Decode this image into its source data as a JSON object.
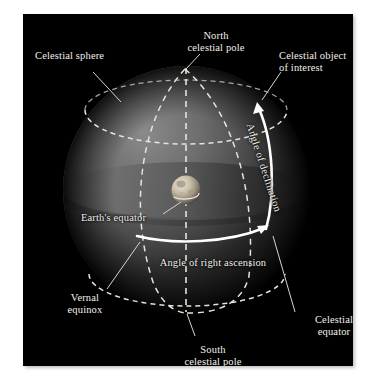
{
  "figure": {
    "background_color": "#ffffff",
    "panel_color": "#000000",
    "label_color": "#f2f0ea",
    "sphere_light_color": "#6a6a6a",
    "sphere_dark_color": "#0b0b0b",
    "equator_plane_color": "#5e5e5e",
    "earth_color": "#cfc6b4",
    "arrow_color": "#ffffff",
    "dashed_line_color": "#e8e4da"
  },
  "labels": {
    "celestial_sphere": "Celestial sphere",
    "north_celestial_pole": "North\ncelestial pole",
    "celestial_object": "Celestial object\nof interest",
    "angle_of_declination": "Angle of declination",
    "earths_equator": "Earth's equator",
    "angle_of_right_ascension": "Angle of right ascension",
    "vernal_equinox": "Vernal\nequinox",
    "south_celestial_pole": "South\ncelestial pole",
    "celestial_equator": "Celestial\nequator"
  },
  "diagram": {
    "type": "celestial-coordinates",
    "sphere": {
      "cx": 163,
      "cy": 176,
      "rx": 123,
      "ry": 124
    },
    "earth": {
      "cx": 163,
      "cy": 176,
      "r": 14
    },
    "poles": {
      "north": [
        162,
        54
      ],
      "south": [
        163,
        298
      ]
    },
    "object_point": [
      236,
      90
    ],
    "ra_arc": {
      "start": [
        115,
        222
      ],
      "end": [
        243,
        214
      ]
    },
    "dec_arc": {
      "start": [
        243,
        214
      ],
      "end": [
        236,
        90
      ]
    }
  }
}
